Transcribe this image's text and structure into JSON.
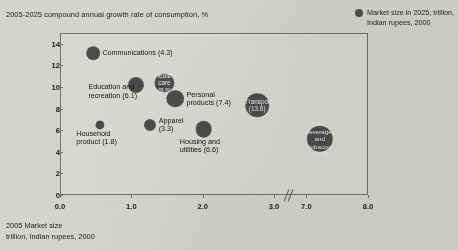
{
  "axis_titles": {
    "y": "2005-2025 compound annual growth rate of consumption, %",
    "x_line1": "2005 Market size",
    "x_line2": "trillion, Indian rupees, 2000"
  },
  "legend": {
    "swatch_name": "bubble-size-swatch",
    "text": "Market size in 2025, trillion, Indian rupees, 2000"
  },
  "chart_data": {
    "type": "scatter",
    "title": "2005-2025 compound annual growth rate of consumption, %",
    "xlabel": "2005 Market size, trillion, Indian rupees, 2000",
    "ylabel": "2005-2025 compound annual growth rate of consumption, %",
    "xlim": [
      0.0,
      8.0
    ],
    "ylim": [
      0,
      15
    ],
    "grid": false,
    "legend_position": "top-right",
    "axis_break": {
      "after": 3.0,
      "before": 7.0,
      "note": "x-axis break between 3.0 and 7.0"
    },
    "x_ticks": [
      "0.0",
      "1.0",
      "2.0",
      "3.0",
      "7.0",
      "8.0"
    ],
    "y_ticks": [
      "0",
      "2",
      "4",
      "6",
      "8",
      "10",
      "12",
      "14"
    ],
    "size_legend": "Market size in 2025, trillion, Indian rupees, 2000",
    "points": [
      {
        "label": "Communications",
        "size_2025": 4.3,
        "label_text": "Communications (4.3)",
        "x": 0.45,
        "y": 13.2,
        "label_placement": "right",
        "label_inside": false
      },
      {
        "label": "Education and recreation",
        "size_2025": 6.1,
        "label_text": "Education and\nrecreation (6.1)",
        "x": 1.05,
        "y": 10.3,
        "label_placement": "below-left",
        "label_inside": false
      },
      {
        "label": "Health-care",
        "size_2025": 8.9,
        "label_text": "Health-\ncare\n(8.9)",
        "x": 1.45,
        "y": 10.5,
        "label_placement": "inside",
        "label_inside": true
      },
      {
        "label": "Personal products",
        "size_2025": 7.4,
        "label_text": "Personal\nproducts (7.4)",
        "x": 1.6,
        "y": 9.0,
        "label_placement": "right",
        "label_inside": false
      },
      {
        "label": "Household product",
        "size_2025": 1.8,
        "label_text": "Household\nproduct (1.8)",
        "x": 0.55,
        "y": 6.6,
        "label_placement": "below",
        "label_inside": false
      },
      {
        "label": "Apparel",
        "size_2025": 3.3,
        "label_text": "Apparel\n(3.3)",
        "x": 1.25,
        "y": 6.6,
        "label_placement": "right",
        "label_inside": false
      },
      {
        "label": "Housing and utilities",
        "size_2025": 6.6,
        "label_text": "Housing and\nutilities (6.6)",
        "x": 2.0,
        "y": 6.2,
        "label_placement": "below",
        "label_inside": false
      },
      {
        "label": "Transport",
        "size_2025": 13.6,
        "label_text": "Transport\n(13.6)",
        "x": 2.75,
        "y": 8.4,
        "label_placement": "inside",
        "label_inside": true
      },
      {
        "label": "Food, beverages, and tobacco",
        "size_2025": 17.3,
        "label_text": "Food,\nbeverages,\nand tobacco\n(17.3)",
        "x": 7.2,
        "y": 5.3,
        "label_placement": "inside",
        "label_inside": true
      }
    ]
  },
  "colors": {
    "background": "#d6d4cf",
    "bubble": "#4b4b4b",
    "frame": "#6f6f6f",
    "text": "#1a1a1a",
    "bubble_label": "#e9e9e9"
  }
}
